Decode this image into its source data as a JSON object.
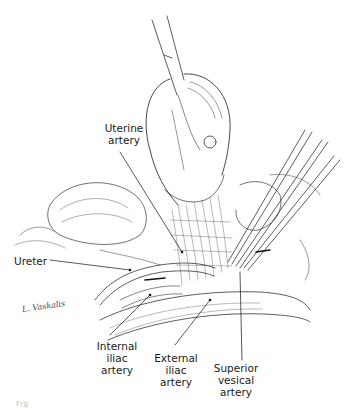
{
  "figure": {
    "signature": "L. Vaskalis",
    "labels": {
      "uterine_artery": "Uterine\nartery",
      "ureter": "Ureter",
      "internal_iliac_artery": "Internal\niliac\nartery",
      "external_iliac_artery": "External\niliac\nartery",
      "superior_vesical_artery": "Superior\nvesical\nartery"
    },
    "caption": "Fig"
  }
}
